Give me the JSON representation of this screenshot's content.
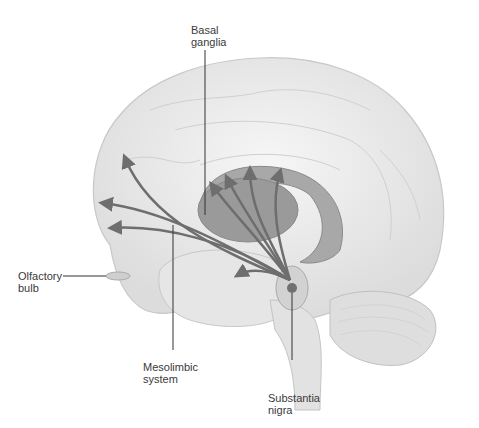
{
  "diagram": {
    "labels": {
      "basal_ganglia": "Basal\nganglia",
      "olfactory_bulb": "Olfactory\nbulb",
      "mesolimbic_system": "Mesolimbic\nsystem",
      "substantia_nigra": "Substantia\nnigra"
    },
    "colors": {
      "brain_fill": "#ececec",
      "brain_outline": "#c8c8c8",
      "basal_ganglia_fill": "#9a9a9a",
      "arrow": "#6e6e6e",
      "nigra_dot": "#707070",
      "leader_line": "#333333",
      "label_text": "#3a3a3a"
    }
  }
}
